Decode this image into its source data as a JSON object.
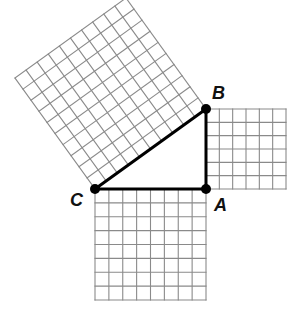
{
  "vertices": {
    "A": {
      "label": "A",
      "x": 206,
      "y": 189
    },
    "B": {
      "label": "B",
      "x": 206,
      "y": 109
    },
    "C": {
      "label": "C",
      "x": 95,
      "y": 189
    }
  },
  "squares": {
    "leg_bottom": {
      "side": "CA",
      "grid_units": 8
    },
    "leg_right": {
      "side": "AB",
      "grid_units": 6
    },
    "hypotenuse": {
      "side": "CB",
      "grid_units": 10
    }
  },
  "colors": {
    "grid_line": "#8a8a8a",
    "triangle": "#000000",
    "label": "#111111"
  }
}
